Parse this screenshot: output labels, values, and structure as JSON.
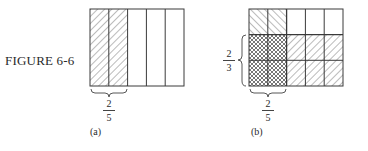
{
  "figure": {
    "label": "FIGURE 6-6",
    "panels": [
      {
        "id": "a",
        "caption": "(a)",
        "columns": 5,
        "rows": 1,
        "shaded_columns": 2,
        "fraction_bottom": {
          "numerator": "2",
          "denominator": "5"
        }
      },
      {
        "id": "b",
        "caption": "(b)",
        "columns": 5,
        "rows": 3,
        "shaded_columns": 2,
        "shaded_rows": 2,
        "fraction_bottom": {
          "numerator": "2",
          "denominator": "5"
        },
        "fraction_left": {
          "numerator": "2",
          "denominator": "3"
        }
      }
    ]
  },
  "colors": {
    "line": "#3a3a3a",
    "hatch": "#555555",
    "background": "#ffffff"
  }
}
